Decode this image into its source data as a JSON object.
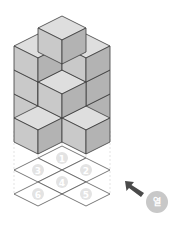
{
  "figure": {
    "cube_colors": {
      "top": "#dedede",
      "left": "#c9c9c9",
      "right": "#b3b3b3",
      "edge": "#3a3a3a"
    },
    "grid_cells": [
      {
        "label": "1"
      },
      {
        "label": "2"
      },
      {
        "label": "3"
      },
      {
        "label": "4"
      },
      {
        "label": "5"
      },
      {
        "label": "6"
      }
    ]
  },
  "controls": {
    "open_button_label": "열",
    "open_button_color": "#c8c8c8",
    "arrow_color": "#4a4a4a"
  }
}
